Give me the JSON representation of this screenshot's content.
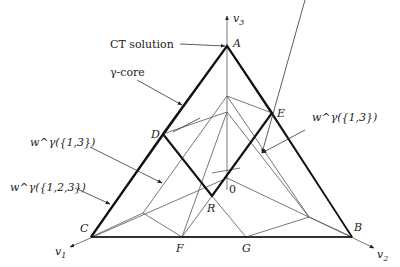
{
  "diagram": {
    "axes": {
      "v1": {
        "label": "v",
        "sub": "1"
      },
      "v2": {
        "label": "v",
        "sub": "2"
      },
      "v3": {
        "label": "v",
        "sub": "3"
      }
    },
    "vertices": {
      "A": "A",
      "B": "B",
      "C": "C",
      "D": "D",
      "E": "E",
      "F": "F",
      "G": "G",
      "R": "R",
      "origin": "0"
    },
    "annotations": {
      "ct_solution": "CT solution",
      "gamma_core": "γ-core",
      "w_13_right": "w^γ({1,3})",
      "w_13_left": "w^γ({1,3})",
      "w_123": "w^γ({1,2,3})"
    },
    "colors": {
      "line": "#111111",
      "thin_line": "#555555",
      "background": "#ffffff"
    }
  }
}
